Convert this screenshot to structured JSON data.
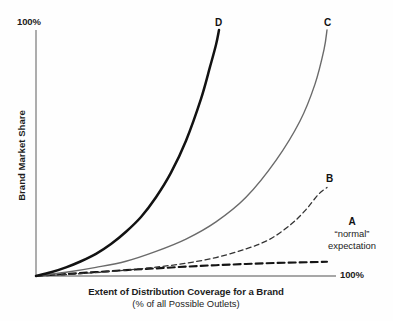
{
  "chart_data": {
    "type": "line",
    "title": "",
    "xlabel": "Extent of Distribution Coverage for a Brand",
    "xlabel_sub": "(% of all Possible Outlets)",
    "ylabel": "Brand Market Share",
    "x_tick_labels": [
      "100%"
    ],
    "y_tick_labels": [
      "100%"
    ],
    "xlim": [
      0,
      100
    ],
    "ylim": [
      0,
      100
    ],
    "grid": false,
    "legend_position": "inline-end-labels",
    "annotations": [
      {
        "name": "a-normal-expectation",
        "title": "A",
        "line1": "“normal”",
        "line2": "expectation"
      }
    ],
    "series": [
      {
        "name": "D",
        "label": "D",
        "style": "solid",
        "color": "#121212",
        "width": 2.5,
        "x": [
          0,
          5,
          10,
          15,
          20,
          25,
          30,
          35,
          40,
          45,
          50,
          55,
          58,
          60,
          61
        ],
        "y": [
          0,
          1.5,
          3.5,
          6,
          9,
          13,
          18,
          24,
          32,
          42,
          55,
          72,
          85,
          94,
          100
        ]
      },
      {
        "name": "C",
        "label": "C",
        "style": "solid",
        "color": "#6a6a6a",
        "width": 1.4,
        "x": [
          0,
          10,
          20,
          30,
          40,
          50,
          60,
          70,
          80,
          88,
          93,
          96,
          97
        ],
        "y": [
          0,
          1.5,
          3.5,
          6,
          10,
          15,
          22,
          32,
          47,
          63,
          78,
          92,
          100
        ]
      },
      {
        "name": "B",
        "label": "B",
        "style": "dashed",
        "color": "#333333",
        "width": 1.3,
        "x": [
          0,
          10,
          20,
          30,
          40,
          50,
          60,
          70,
          78,
          85,
          90,
          94,
          97
        ],
        "y": [
          0,
          0.6,
          1.4,
          2.4,
          3.6,
          5.2,
          7.5,
          11,
          15,
          21,
          27,
          33,
          36
        ]
      },
      {
        "name": "A",
        "label": "A",
        "style": "dashed",
        "color": "#151515",
        "width": 2.1,
        "x": [
          0,
          10,
          20,
          30,
          40,
          50,
          60,
          70,
          80,
          90,
          97
        ],
        "y": [
          0,
          0.8,
          1.6,
          2.4,
          3.1,
          3.8,
          4.4,
          4.9,
          5.3,
          5.6,
          5.8
        ]
      }
    ],
    "axis_color": "#8a8a8a"
  }
}
